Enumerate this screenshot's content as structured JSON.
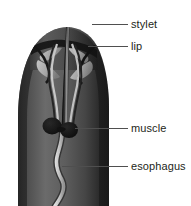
{
  "figure": {
    "background_color": "#ffffff",
    "width": 191,
    "height": 206
  },
  "labels": [
    {
      "id": "stylet",
      "text": "stylet",
      "leader_from": [
        92,
        24
      ],
      "leader_to": [
        128,
        24
      ]
    },
    {
      "id": "lip",
      "text": "lip",
      "leader_from": [
        88,
        46
      ],
      "leader_to": [
        128,
        46
      ]
    },
    {
      "id": "muscle",
      "text": "muscle",
      "leader_from": [
        75,
        128
      ],
      "leader_to": [
        128,
        128
      ]
    },
    {
      "id": "esophagus",
      "text": "esophagus",
      "leader_from": [
        62,
        166
      ],
      "leader_to": [
        128,
        166
      ]
    }
  ],
  "structures": {
    "body": {
      "name": "body-outline",
      "fill_dark": "#2b2b2b",
      "fill_mid": "#4a4a4a",
      "fill_light": "#6e6e6e"
    },
    "stylet": {
      "name": "stylet-spear",
      "fill": "#1a1a1a",
      "highlight": "#8c8c8c",
      "tip_y": 14,
      "base_y": 131
    },
    "lip": {
      "name": "lip-lobes",
      "fill_light": "#bdbdbd",
      "fill_dark": "#151515"
    },
    "muscle": {
      "name": "muscle-pair",
      "fill": "#0d0d0d",
      "left_center": [
        52,
        126
      ],
      "right_center": [
        68,
        130
      ],
      "radius": 9
    },
    "esophagus": {
      "name": "esophagus-tube",
      "fill": "#d8d8d8",
      "stroke": "#2a2a2a"
    }
  },
  "colors": {
    "text": "#231f20",
    "leader_line": "#4f4f4f",
    "background": "#ffffff"
  }
}
